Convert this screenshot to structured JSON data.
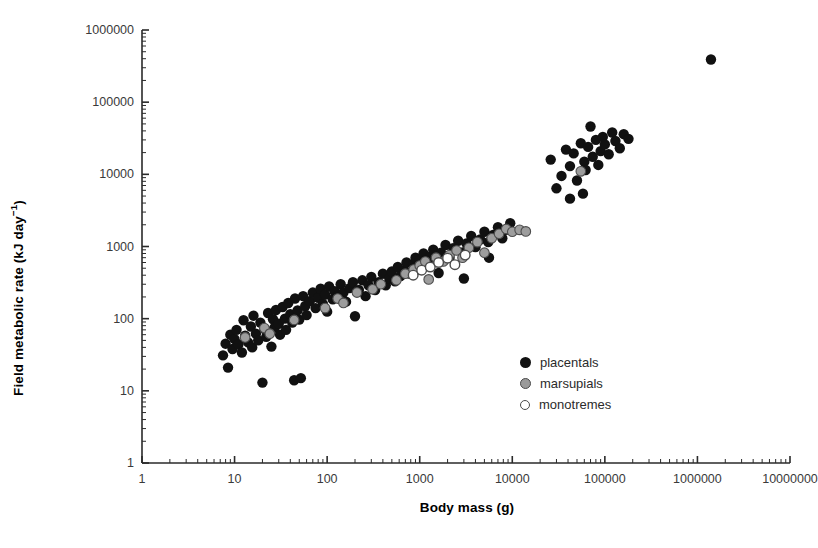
{
  "chart_data": {
    "type": "scatter",
    "title": "",
    "xlabel": "Body mass (g)",
    "ylabel": "Field metabolic rate (kJ day⁻¹)",
    "xscale": "log",
    "yscale": "log",
    "xlim": [
      1,
      10000000
    ],
    "ylim": [
      1,
      1000000
    ],
    "grid": false,
    "legend_position": "center-right-inside",
    "xticks": [
      1,
      10,
      100,
      1000,
      10000,
      100000,
      1000000,
      10000000
    ],
    "xtick_labels": [
      "1",
      "10",
      "100",
      "1000",
      "10000",
      "100000",
      "1000000",
      "10000000"
    ],
    "yticks": [
      1,
      10,
      100,
      1000,
      10000,
      100000,
      1000000
    ],
    "ytick_labels": [
      "1",
      "10",
      "100",
      "1000",
      "10000",
      "100000",
      "1000000"
    ],
    "minor_ticks": true,
    "series": [
      {
        "name": "placentals",
        "marker": "filled-circle",
        "color": "#111111",
        "points": [
          [
            7.5,
            31
          ],
          [
            8,
            45
          ],
          [
            8.5,
            21
          ],
          [
            9,
            60
          ],
          [
            9.5,
            38
          ],
          [
            10,
            52
          ],
          [
            10.5,
            70
          ],
          [
            11,
            44
          ],
          [
            12,
            34
          ],
          [
            12.5,
            95
          ],
          [
            13,
            58
          ],
          [
            14,
            47
          ],
          [
            15,
            78
          ],
          [
            15.5,
            40
          ],
          [
            16,
            110
          ],
          [
            17,
            62
          ],
          [
            18,
            50
          ],
          [
            19,
            88
          ],
          [
            20,
            13
          ],
          [
            21,
            72
          ],
          [
            22,
            56
          ],
          [
            23,
            120
          ],
          [
            24,
            66
          ],
          [
            25,
            41
          ],
          [
            26,
            98
          ],
          [
            27,
            75
          ],
          [
            28,
            132
          ],
          [
            30,
            85
          ],
          [
            31,
            60
          ],
          [
            33,
            145
          ],
          [
            35,
            100
          ],
          [
            36,
            70
          ],
          [
            38,
            165
          ],
          [
            40,
            115
          ],
          [
            42,
            88
          ],
          [
            44,
            14
          ],
          [
            45,
            190
          ],
          [
            48,
            130
          ],
          [
            50,
            97
          ],
          [
            52,
            15
          ],
          [
            55,
            205
          ],
          [
            58,
            150
          ],
          [
            60,
            112
          ],
          [
            65,
            175
          ],
          [
            70,
            230
          ],
          [
            75,
            140
          ],
          [
            80,
            195
          ],
          [
            85,
            260
          ],
          [
            90,
            160
          ],
          [
            95,
            215
          ],
          [
            100,
            125
          ],
          [
            105,
            280
          ],
          [
            115,
            185
          ],
          [
            120,
            240
          ],
          [
            130,
            205
          ],
          [
            140,
            300
          ],
          [
            150,
            230
          ],
          [
            160,
            172
          ],
          [
            175,
            265
          ],
          [
            190,
            320
          ],
          [
            200,
            108
          ],
          [
            220,
            250
          ],
          [
            240,
            340
          ],
          [
            260,
            205
          ],
          [
            280,
            290
          ],
          [
            300,
            380
          ],
          [
            330,
            250
          ],
          [
            360,
            320
          ],
          [
            400,
            420
          ],
          [
            430,
            290
          ],
          [
            470,
            360
          ],
          [
            500,
            450
          ],
          [
            540,
            330
          ],
          [
            580,
            520
          ],
          [
            620,
            390
          ],
          [
            680,
            470
          ],
          [
            720,
            600
          ],
          [
            780,
            420
          ],
          [
            850,
            560
          ],
          [
            900,
            700
          ],
          [
            950,
            480
          ],
          [
            1000,
            640
          ],
          [
            1100,
            800
          ],
          [
            1200,
            560
          ],
          [
            1300,
            720
          ],
          [
            1400,
            900
          ],
          [
            1500,
            640
          ],
          [
            1700,
            820
          ],
          [
            1900,
            1050
          ],
          [
            2100,
            700
          ],
          [
            2300,
            950
          ],
          [
            2600,
            1200
          ],
          [
            2900,
            830
          ],
          [
            3200,
            1100
          ],
          [
            3600,
            1400
          ],
          [
            4000,
            980
          ],
          [
            4500,
            1250
          ],
          [
            5000,
            1600
          ],
          [
            5500,
            1150
          ],
          [
            6200,
            1450
          ],
          [
            7000,
            1850
          ],
          [
            7800,
            1300
          ],
          [
            8500,
            1700
          ],
          [
            9500,
            2100
          ],
          [
            3000,
            360
          ],
          [
            5600,
            700
          ],
          [
            1600,
            430
          ],
          [
            26000,
            16000
          ],
          [
            30000,
            6400
          ],
          [
            34000,
            9500
          ],
          [
            38000,
            22000
          ],
          [
            42000,
            13000
          ],
          [
            46000,
            19500
          ],
          [
            50000,
            8200
          ],
          [
            55000,
            27000
          ],
          [
            60000,
            15000
          ],
          [
            62000,
            11500
          ],
          [
            66000,
            24000
          ],
          [
            70000,
            46000
          ],
          [
            74000,
            17500
          ],
          [
            80000,
            30000
          ],
          [
            85000,
            13500
          ],
          [
            90000,
            21000
          ],
          [
            95000,
            33000
          ],
          [
            100000,
            26000
          ],
          [
            110000,
            19000
          ],
          [
            120000,
            38000
          ],
          [
            130000,
            29000
          ],
          [
            145000,
            23000
          ],
          [
            160000,
            36000
          ],
          [
            180000,
            31000
          ],
          [
            42000,
            4600
          ],
          [
            58000,
            5400
          ],
          [
            1400000,
            390000
          ]
        ]
      },
      {
        "name": "marsupials",
        "marker": "gray-circle",
        "color": "#9a9a9a",
        "points": [
          [
            13,
            55
          ],
          [
            21,
            74
          ],
          [
            24,
            62
          ],
          [
            44,
            96
          ],
          [
            95,
            140
          ],
          [
            130,
            190
          ],
          [
            150,
            165
          ],
          [
            210,
            230
          ],
          [
            310,
            255
          ],
          [
            380,
            300
          ],
          [
            560,
            340
          ],
          [
            700,
            420
          ],
          [
            860,
            480
          ],
          [
            1000,
            545
          ],
          [
            1150,
            620
          ],
          [
            1250,
            350
          ],
          [
            1500,
            700
          ],
          [
            1800,
            620
          ],
          [
            2100,
            760
          ],
          [
            2500,
            880
          ],
          [
            2900,
            700
          ],
          [
            3400,
            960
          ],
          [
            4200,
            1150
          ],
          [
            5000,
            820
          ],
          [
            6000,
            1300
          ],
          [
            7200,
            1500
          ],
          [
            8600,
            1750
          ],
          [
            10000,
            1600
          ],
          [
            12000,
            1700
          ],
          [
            14000,
            1620
          ],
          [
            55000,
            11000
          ]
        ]
      },
      {
        "name": "monotremes",
        "marker": "open-circle",
        "color": "#ffffff",
        "points": [
          [
            850,
            400
          ],
          [
            1050,
            470
          ],
          [
            1300,
            520
          ],
          [
            1600,
            600
          ],
          [
            2000,
            690
          ],
          [
            2400,
            560
          ],
          [
            3100,
            760
          ]
        ]
      }
    ]
  },
  "legend": {
    "items": [
      {
        "label": "placentals",
        "marker": "filled-circle"
      },
      {
        "label": "marsupials",
        "marker": "gray-circle"
      },
      {
        "label": "monotremes",
        "marker": "open-circle"
      }
    ]
  },
  "axes": {
    "x_title": "Body mass (g)",
    "y_title_main": "Field metabolic rate (kJ day",
    "y_title_sup": "−1",
    "y_title_tail": ")"
  }
}
